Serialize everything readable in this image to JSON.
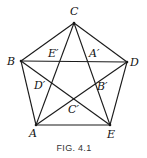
{
  "figure": {
    "caption": "FIG. 4.1",
    "stroke_color": "#1a1a1a",
    "vertices": {
      "A": {
        "x": 36,
        "y": 125,
        "label": "A"
      },
      "B": {
        "x": 21,
        "y": 61,
        "label": "B"
      },
      "C": {
        "x": 74,
        "y": 23,
        "label": "C"
      },
      "D": {
        "x": 127,
        "y": 62,
        "label": "D"
      },
      "E": {
        "x": 110,
        "y": 125,
        "label": "E"
      }
    },
    "inner_points": {
      "A_prime": {
        "label": "A′"
      },
      "B_prime": {
        "label": "B′"
      },
      "C_prime": {
        "label": "C′"
      },
      "D_prime": {
        "label": "D′"
      },
      "E_prime": {
        "label": "E′"
      }
    }
  }
}
